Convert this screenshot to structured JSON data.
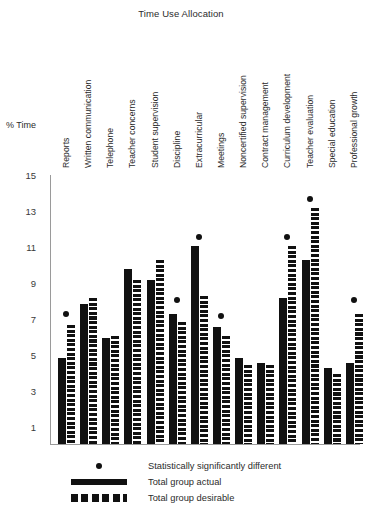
{
  "chart_data": {
    "type": "bar",
    "title": "Time Use Allocation",
    "xlabel": "",
    "ylabel": "% Time",
    "ylim": [
      0,
      15
    ],
    "yticks": [
      1,
      3,
      5,
      7,
      9,
      11,
      13,
      15
    ],
    "grid": false,
    "legend_position": "bottom",
    "categories": [
      "Reports",
      "Written communication",
      "Telephone",
      "Teacher concerns",
      "Student supervision",
      "Discipline",
      "Extracurricular",
      "Meetings",
      "Noncertified supervision",
      "Contract management",
      "Curriculum development",
      "Teacher evaluation",
      "Special education",
      "Professional growth"
    ],
    "series": [
      {
        "name": "Total group actual",
        "values": [
          4.8,
          7.8,
          5.9,
          9.7,
          9.1,
          7.2,
          11.0,
          6.5,
          4.8,
          4.5,
          8.1,
          10.2,
          4.2,
          4.5
        ]
      },
      {
        "name": "Total group desirable",
        "values": [
          6.6,
          8.1,
          6.0,
          9.1,
          10.2,
          6.8,
          8.2,
          6.0,
          4.4,
          4.4,
          11.0,
          13.1,
          3.9,
          7.2
        ]
      }
    ],
    "significance_markers": {
      "name": "Statistically significantly different",
      "points": [
        {
          "category": "Reports",
          "value": 7.0
        },
        {
          "category": "Discipline",
          "value": 7.8
        },
        {
          "category": "Extracurricular",
          "value": 11.3
        },
        {
          "category": "Meetings",
          "value": 6.9
        },
        {
          "category": "Curriculum development",
          "value": 11.3
        },
        {
          "category": "Teacher evaluation",
          "value": 13.4
        },
        {
          "category": "Professional growth",
          "value": 7.8
        }
      ]
    }
  },
  "legend": {
    "items": [
      {
        "key": "dot",
        "label": "Statistically significantly different"
      },
      {
        "key": "solid",
        "label": "Total group actual"
      },
      {
        "key": "dashed",
        "label": "Total group desirable"
      }
    ]
  },
  "colors": {
    "series": "#111111",
    "axis": "#9a9a9a",
    "text": "#2b2b2b",
    "background": "#ffffff"
  }
}
